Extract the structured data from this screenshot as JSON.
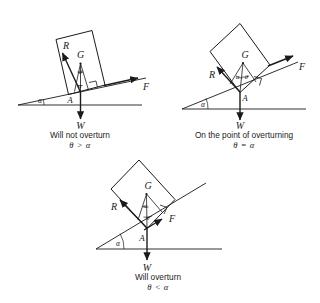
{
  "figure_title": "Overturning of a block on an inclined plane",
  "labels": {
    "reaction": "R",
    "centre_of_gravity": "G",
    "weight": "W",
    "friction": "F",
    "contact_point": "A",
    "slope_angle": "α",
    "theta_angle": "θ"
  },
  "panels": [
    {
      "id": "panel-will-not-overturn",
      "caption": "Will not overturn",
      "condition": "θ > α",
      "incline_angle_deg": 12,
      "vectors": [
        "R",
        "G",
        "W",
        "F"
      ],
      "angle_marks": [
        "α",
        "θ"
      ],
      "point": "A"
    },
    {
      "id": "panel-on-the-point-of-overturning",
      "caption": "On the point of overturning",
      "condition": "θ = α",
      "incline_angle_deg": 22,
      "vectors": [
        "R",
        "G",
        "W",
        "F"
      ],
      "angle_marks": [
        "α",
        "θ"
      ],
      "point": "A"
    },
    {
      "id": "panel-will-overturn",
      "caption": "Will overturn",
      "condition": "θ < α",
      "incline_angle_deg": 32,
      "vectors": [
        "R",
        "G",
        "W",
        "F"
      ],
      "angle_marks": [
        "α",
        "θ"
      ],
      "point": "A"
    }
  ],
  "colors": {
    "line": "#1a1a1a",
    "background": "#ffffff",
    "text": "#1c1c1c"
  }
}
